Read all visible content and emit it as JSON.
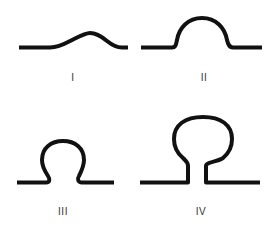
{
  "figure": {
    "stroke_color": "#111111",
    "background": "#ffffff",
    "panels": [
      {
        "id": "I",
        "label": "I",
        "description": "shallow gentle bump"
      },
      {
        "id": "II",
        "label": "II",
        "description": "semicircular arch"
      },
      {
        "id": "III",
        "label": "III",
        "description": "omega-shaped loop"
      },
      {
        "id": "IV",
        "label": "IV",
        "description": "balloon loop with narrow neck"
      }
    ]
  }
}
